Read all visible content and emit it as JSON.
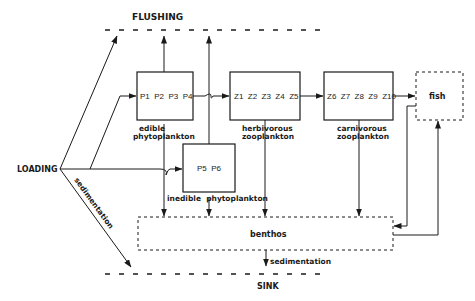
{
  "diagram": {
    "labels": {
      "flushing": "FLUSHING",
      "sink": "SINK",
      "loading": "LOADING",
      "sedimentation_diagonal": "sedimentation",
      "sedimentation_bottom": "sedimentation"
    },
    "compartments": {
      "edible": {
        "species": "P1  P2  P3  P4",
        "caption_line1": "edible",
        "caption_line2": "phytoplankton"
      },
      "inedible": {
        "species": "P5  P6",
        "caption": "inedible  phytoplankton"
      },
      "herbivorous": {
        "species": "Z1  Z2  Z3  Z4  Z5",
        "caption_line1": "herbivorous",
        "caption_line2": "zooplankton"
      },
      "carnivorous": {
        "species": "Z6  Z7  Z8  Z9  Z10",
        "caption_line1": "carnivorous",
        "caption_line2": "zooplankton"
      },
      "fish": {
        "label": "fish"
      },
      "benthos": {
        "label": "benthos"
      }
    },
    "colors": {
      "ink": "#1a1a1a",
      "background": "#ffffff"
    }
  }
}
